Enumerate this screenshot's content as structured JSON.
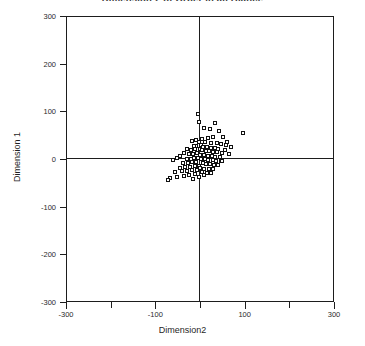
{
  "chart_data": {
    "type": "scatter",
    "title": "Dimension 2 of Orber in all Blance",
    "xlabel": "Dimension2",
    "ylabel": "Dimension 1",
    "xlim": [
      -300,
      300
    ],
    "ylim": [
      -300,
      300
    ],
    "grid": false,
    "legend": null,
    "marker_style": "open-square",
    "marker_color": "#101010",
    "x_ticks": [
      {
        "value": -300,
        "label": "-300",
        "major": true
      },
      {
        "value": -200,
        "label": "",
        "major": false
      },
      {
        "value": -100,
        "label": "-100",
        "major": true
      },
      {
        "value": 0,
        "label": "",
        "major": false
      },
      {
        "value": 100,
        "label": "100",
        "major": true
      },
      {
        "value": 200,
        "label": "",
        "major": false
      },
      {
        "value": 300,
        "label": "300",
        "major": true
      }
    ],
    "y_ticks": [
      {
        "value": 300,
        "label": "300"
      },
      {
        "value": 200,
        "label": "200"
      },
      {
        "value": 100,
        "label": "100"
      },
      {
        "value": 0,
        "label": "0"
      },
      {
        "value": -100,
        "label": "-100"
      },
      {
        "value": -200,
        "label": "-200"
      },
      {
        "value": -300,
        "label": "-300"
      }
    ],
    "points": [
      [
        -5,
        95
      ],
      [
        -2,
        78
      ],
      [
        33,
        75
      ],
      [
        8,
        64
      ],
      [
        22,
        62
      ],
      [
        43,
        58
      ],
      [
        97,
        54
      ],
      [
        52,
        47
      ],
      [
        30,
        46
      ],
      [
        18,
        44
      ],
      [
        4,
        42
      ],
      [
        -10,
        40
      ],
      [
        -18,
        38
      ],
      [
        -3,
        36
      ],
      [
        12,
        35
      ],
      [
        25,
        34
      ],
      [
        38,
        33
      ],
      [
        46,
        32
      ],
      [
        58,
        30
      ],
      [
        2,
        29
      ],
      [
        -8,
        28
      ],
      [
        -14,
        27
      ],
      [
        7,
        26
      ],
      [
        16,
        25
      ],
      [
        24,
        24
      ],
      [
        33,
        23
      ],
      [
        41,
        22
      ],
      [
        -1,
        21
      ],
      [
        -12,
        20
      ],
      [
        -20,
        19
      ],
      [
        5,
        18
      ],
      [
        13,
        17
      ],
      [
        21,
        16
      ],
      [
        29,
        15
      ],
      [
        37,
        14
      ],
      [
        49,
        13
      ],
      [
        -6,
        12
      ],
      [
        -16,
        11
      ],
      [
        -24,
        10
      ],
      [
        0,
        9
      ],
      [
        9,
        8
      ],
      [
        17,
        7
      ],
      [
        26,
        6
      ],
      [
        34,
        5
      ],
      [
        44,
        4
      ],
      [
        -4,
        3
      ],
      [
        -13,
        2
      ],
      [
        -21,
        1
      ],
      [
        -30,
        0
      ],
      [
        3,
        0
      ],
      [
        11,
        -1
      ],
      [
        19,
        -2
      ],
      [
        28,
        -3
      ],
      [
        36,
        -4
      ],
      [
        47,
        -5
      ],
      [
        -9,
        -6
      ],
      [
        -18,
        -7
      ],
      [
        -27,
        -8
      ],
      [
        -38,
        -8
      ],
      [
        6,
        -9
      ],
      [
        14,
        -10
      ],
      [
        23,
        -11
      ],
      [
        31,
        -12
      ],
      [
        40,
        -13
      ],
      [
        -2,
        -14
      ],
      [
        -11,
        -15
      ],
      [
        -22,
        -16
      ],
      [
        -33,
        -17
      ],
      [
        -45,
        -18
      ],
      [
        1,
        -19
      ],
      [
        10,
        -20
      ],
      [
        20,
        -21
      ],
      [
        29,
        -22
      ],
      [
        -7,
        -23
      ],
      [
        -17,
        -24
      ],
      [
        -28,
        -25
      ],
      [
        -41,
        -26
      ],
      [
        -57,
        -27
      ],
      [
        4,
        -28
      ],
      [
        15,
        -29
      ],
      [
        25,
        -30
      ],
      [
        -12,
        -32
      ],
      [
        -24,
        -34
      ],
      [
        -36,
        -36
      ],
      [
        -52,
        -38
      ],
      [
        -68,
        -40
      ],
      [
        -72,
        -44
      ],
      [
        8,
        -34
      ],
      [
        -3,
        -38
      ],
      [
        -16,
        -42
      ],
      [
        61,
        36
      ],
      [
        69,
        25
      ],
      [
        55,
        18
      ],
      [
        64,
        10
      ],
      [
        50,
        -4
      ],
      [
        -35,
        12
      ],
      [
        -44,
        6
      ],
      [
        -52,
        2
      ],
      [
        -60,
        -2
      ],
      [
        -30,
        22
      ]
    ]
  },
  "axes": {
    "x_title": "Dimension2",
    "y_title": "Dimension 1"
  }
}
